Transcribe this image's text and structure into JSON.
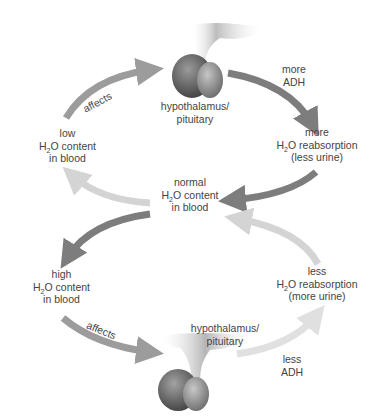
{
  "diagram": {
    "colors": {
      "dark_arrow": "#7d7d7d",
      "light_arrow": "#d2d2d2",
      "mid_arrow": "#9c9c9c",
      "gland": "#7a7a7a",
      "text": "#444444"
    },
    "center": {
      "line1": "normal",
      "line2_pre": "H",
      "line2_sub": "2",
      "line2_post": "O content",
      "line3": "in blood"
    },
    "top_gland": {
      "line1": "hypothalamus/",
      "line2": "pituitary"
    },
    "bottom_gland": {
      "line1": "hypothalamus/",
      "line2": "pituitary"
    },
    "low_water": {
      "line1": "low",
      "line2_pre": "H",
      "line2_sub": "2",
      "line2_post": "O content",
      "line3": "in blood",
      "arrow_label": "affects"
    },
    "more_adh": {
      "line1": "more",
      "line2": "ADH"
    },
    "more_reabsorption": {
      "line1": "more",
      "line2_pre": "H",
      "line2_sub": "2",
      "line2_post": "O reabsorption",
      "line3": "(less urine)"
    },
    "high_water": {
      "line1": "high",
      "line2_pre": "H",
      "line2_sub": "2",
      "line2_post": "O content",
      "line3": "in blood",
      "arrow_label": "affects"
    },
    "less_adh": {
      "line1": "less",
      "line2": "ADH"
    },
    "less_reabsorption": {
      "line1": "less",
      "line2_pre": "H",
      "line2_sub": "2",
      "line2_post": "O reabsorption",
      "line3": "(more urine)"
    }
  }
}
